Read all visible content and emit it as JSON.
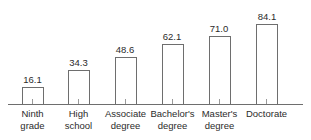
{
  "chart_data": {
    "type": "bar",
    "title": "",
    "subtitle": "",
    "xlabel": "",
    "ylabel": "",
    "categories": [
      "Ninth grade",
      "High school",
      "Associate degree",
      "Bachelor's degree",
      "Master's degree",
      "Doctorate"
    ],
    "category_lines": [
      [
        "Ninth",
        "grade"
      ],
      [
        "High",
        "school"
      ],
      [
        "Associate",
        "degree"
      ],
      [
        "Bachelor's",
        "degree"
      ],
      [
        "Master's",
        "degree"
      ],
      [
        "Doctorate",
        ""
      ]
    ],
    "values": [
      16.1,
      34.3,
      48.6,
      62.1,
      71.0,
      84.1
    ],
    "value_labels": [
      "16.1",
      "34.3",
      "48.6",
      "62.1",
      "71.0",
      "84.1"
    ],
    "ylim": [
      0,
      100
    ],
    "grid": false,
    "legend": null,
    "axis_line": true,
    "tick_marks": true,
    "bar_style": "outline",
    "colors": {
      "background": "#ffffff",
      "bar_stroke": "#6e6e6e",
      "bar_fill": "#ffffff",
      "axis": "#6e6e6e",
      "tick": "#9a9a9a",
      "text": "#2b2b2b"
    }
  },
  "geometry": {
    "axis_y": 104,
    "axis_x_start": 8,
    "axis_x_end": 303,
    "bar_width": 21,
    "bar_centers": [
      32.5,
      78.5,
      125.0,
      172.0,
      219.0,
      266.5
    ],
    "bar_tops": [
      87,
      70,
      57,
      44,
      36,
      24
    ],
    "tick_length": 5
  }
}
